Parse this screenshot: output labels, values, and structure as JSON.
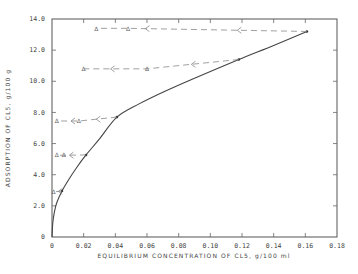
{
  "chart_data": {
    "type": "line",
    "title": "",
    "xlabel": "EQUILIBRIUM CONCENTRATION OF CL5, g/100 ml",
    "ylabel": "ADSORPTION OF CL5, g/100 g",
    "xlim": [
      0,
      0.18
    ],
    "ylim": [
      0,
      14.0
    ],
    "x_ticks": [
      0,
      0.02,
      0.04,
      0.06,
      0.08,
      0.1,
      0.12,
      0.14,
      0.16,
      0.18
    ],
    "x_tick_labels": [
      "0",
      "0.02",
      "0.04",
      "0.06",
      "0.08",
      "0.10",
      "0.12",
      "0.14",
      "0.16",
      "0.18"
    ],
    "y_ticks": [
      0,
      2,
      4,
      6,
      8,
      10,
      12,
      14
    ],
    "y_tick_labels": [
      "0",
      "2.0",
      "4.0",
      "6.0",
      "8.0",
      "10.0",
      "12.0",
      "14.0"
    ],
    "grid": false,
    "legend": null,
    "series": [
      {
        "name": "Adsorption isotherm",
        "style": "solid",
        "marker": "dot",
        "x": [
          0,
          0.0063,
          0.0215,
          0.041,
          0.118,
          0.161
        ],
        "y": [
          0,
          2.95,
          5.27,
          7.7,
          11.4,
          13.2
        ]
      },
      {
        "name": "Desorption path 1",
        "style": "dashed",
        "marker": "triangle",
        "start": [
          0.161,
          13.2
        ],
        "x": [
          0.048,
          0.028
        ],
        "y": [
          13.4,
          13.4
        ],
        "arrows_x": [
          0.117,
          0.059
        ]
      },
      {
        "name": "Desorption path 2",
        "style": "dashed",
        "marker": "triangle",
        "start": [
          0.118,
          11.4
        ],
        "x": [
          0.06,
          0.02
        ],
        "y": [
          10.8,
          10.8
        ],
        "arrows_x": [
          0.088,
          0.037
        ]
      },
      {
        "name": "Desorption path 3",
        "style": "dashed",
        "marker": "triangle",
        "start": [
          0.041,
          7.7
        ],
        "x": [
          0.017,
          0.003
        ],
        "y": [
          7.45,
          7.45
        ],
        "arrows_x": [
          0.028,
          0.012
        ]
      },
      {
        "name": "Desorption path 4",
        "style": "dashed",
        "marker": "triangle",
        "start": [
          0.0215,
          5.27
        ],
        "x": [
          0.0075,
          0.003
        ],
        "y": [
          5.25,
          5.25
        ],
        "arrows_x": [
          0.011
        ]
      },
      {
        "name": "Desorption path 5",
        "style": "dashed",
        "marker": "triangle",
        "start": [
          0.0063,
          2.95
        ],
        "x": [
          0.001
        ],
        "y": [
          2.9
        ],
        "arrows_x": [
          0.004
        ]
      }
    ],
    "curve_points": [
      [
        0,
        0
      ],
      [
        0.0005,
        0.9
      ],
      [
        0.0015,
        1.6
      ],
      [
        0.003,
        2.2
      ],
      [
        0.0063,
        2.95
      ],
      [
        0.01,
        3.6
      ],
      [
        0.0155,
        4.45
      ],
      [
        0.0215,
        5.27
      ],
      [
        0.03,
        6.3
      ],
      [
        0.041,
        7.7
      ],
      [
        0.055,
        8.55
      ],
      [
        0.07,
        9.3
      ],
      [
        0.09,
        10.2
      ],
      [
        0.118,
        11.4
      ],
      [
        0.14,
        12.3
      ],
      [
        0.161,
        13.2
      ]
    ],
    "triangle_glyph": "Δ"
  }
}
